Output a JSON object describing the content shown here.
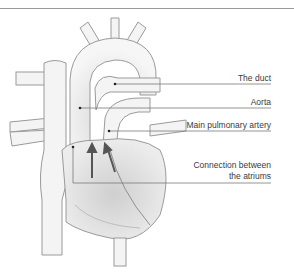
{
  "diagram": {
    "labels": [
      {
        "id": "duct",
        "text": "The duct"
      },
      {
        "id": "aorta",
        "text": "Aorta"
      },
      {
        "id": "pulmonary",
        "text": "Main pulmonary artery"
      },
      {
        "id": "atriums",
        "line1": "Connection between",
        "line2": "the atriums"
      }
    ],
    "colors": {
      "outline": "#9a9a9a",
      "fill": "#f2f2f2",
      "shade": "#c9c9c9",
      "leader": "#7a7a7a",
      "text": "#3a3a3a",
      "arrow": "#555555"
    }
  }
}
